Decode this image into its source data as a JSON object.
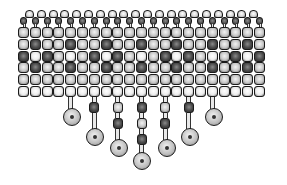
{
  "figure": {
    "grid": {
      "columns": 21,
      "rows": 6,
      "origin_x": 18,
      "origin_y": 27,
      "pitch": 11.8,
      "bead_size": 11,
      "row_patterns": [
        {
          "row": 1,
          "period": [
            "L"
          ]
        },
        {
          "row": 2,
          "period": [
            "L",
            "D",
            "L"
          ]
        },
        {
          "row": 3,
          "period": [
            "D",
            "W",
            "D",
            "L",
            "W",
            "L"
          ]
        },
        {
          "row": 4,
          "period": [
            "L",
            "D",
            "L"
          ]
        },
        {
          "row": 5,
          "period": [
            "L"
          ]
        },
        {
          "row": 6,
          "period": [
            "W"
          ]
        }
      ]
    },
    "top_edge": {
      "arch_beads": 20,
      "anchor_beads": 21
    },
    "pendants": [
      {
        "column": 4,
        "beads": [],
        "disc_center": [
          72,
          117
        ]
      },
      {
        "column": 6,
        "beads": [
          "D"
        ],
        "disc_center": [
          95,
          137
        ]
      },
      {
        "column": 8,
        "beads": [
          "L",
          "D"
        ],
        "disc_center": [
          119,
          148
        ]
      },
      {
        "column": 10,
        "beads": [
          "D",
          "L",
          "D"
        ],
        "disc_center": [
          142,
          161
        ]
      },
      {
        "column": 12,
        "beads": [
          "L",
          "D"
        ],
        "disc_center": [
          167,
          148
        ]
      },
      {
        "column": 14,
        "beads": [
          "D"
        ],
        "disc_center": [
          190,
          137
        ]
      },
      {
        "column": 16,
        "beads": [],
        "disc_center": [
          214,
          117
        ]
      }
    ],
    "colors": {
      "L": "#c8c8c8",
      "D": "#4a4a4a",
      "W": "#ececec",
      "anchor": "#555555",
      "arch": "#d8d8d8",
      "disc": "#bdbdbd",
      "outline": "#1a1a1a"
    }
  }
}
